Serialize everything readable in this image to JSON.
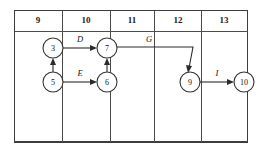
{
  "diagram": {
    "type": "activity-on-node-network",
    "title": "",
    "timeline": {
      "name": "time-scale-header",
      "columns": [
        {
          "label": "9",
          "x_start": 14,
          "x_end": 62
        },
        {
          "label": "10",
          "x_start": 62,
          "x_end": 110
        },
        {
          "label": "11",
          "x_start": 110,
          "x_end": 154
        },
        {
          "label": "12",
          "x_start": 154,
          "x_end": 201
        },
        {
          "label": "13",
          "x_start": 201,
          "x_end": 248
        }
      ],
      "header_top": 10,
      "header_bottom": 31,
      "grid_bottom": 142
    },
    "nodes": [
      {
        "id": "3",
        "label": "3",
        "cx": 53,
        "cy": 48,
        "r": 10
      },
      {
        "id": "7",
        "label": "7",
        "cx": 107,
        "cy": 48,
        "r": 10
      },
      {
        "id": "5",
        "label": "5",
        "cx": 53,
        "cy": 82,
        "r": 10
      },
      {
        "id": "6",
        "label": "6",
        "cx": 107,
        "cy": 82,
        "r": 10
      },
      {
        "id": "9",
        "label": "9",
        "cx": 190,
        "cy": 82,
        "r": 10
      },
      {
        "id": "10",
        "label": "10",
        "cx": 244,
        "cy": 82,
        "r": 10
      }
    ],
    "edges": [
      {
        "id": "edge-3-7",
        "from": "3",
        "to": "7",
        "label": "D",
        "label_x": 80,
        "label_y": 40
      },
      {
        "id": "edge-5-6",
        "from": "5",
        "to": "6",
        "label": "E",
        "label_x": 80,
        "label_y": 74
      },
      {
        "id": "edge-5-3",
        "from": "5",
        "to": "3",
        "label": "",
        "label_x": 0,
        "label_y": 0
      },
      {
        "id": "edge-6-7",
        "from": "6",
        "to": "7",
        "label": "",
        "label_x": 0,
        "label_y": 0
      },
      {
        "id": "edge-7-9",
        "from": "7",
        "to": "9",
        "label": "G",
        "label_x": 149,
        "label_y": 40
      },
      {
        "id": "edge-9-10",
        "from": "9",
        "to": "10",
        "label": "I",
        "label_x": 217,
        "label_y": 74
      }
    ],
    "colors": {
      "background": "#ffffff",
      "grid_stroke": "#4c4c4c",
      "frame_stroke": "#3d3d3d",
      "node_stroke": "#333333",
      "node_fill": "#ffffff",
      "edge_stroke": "#2b2b2b",
      "text": "#111111"
    }
  }
}
